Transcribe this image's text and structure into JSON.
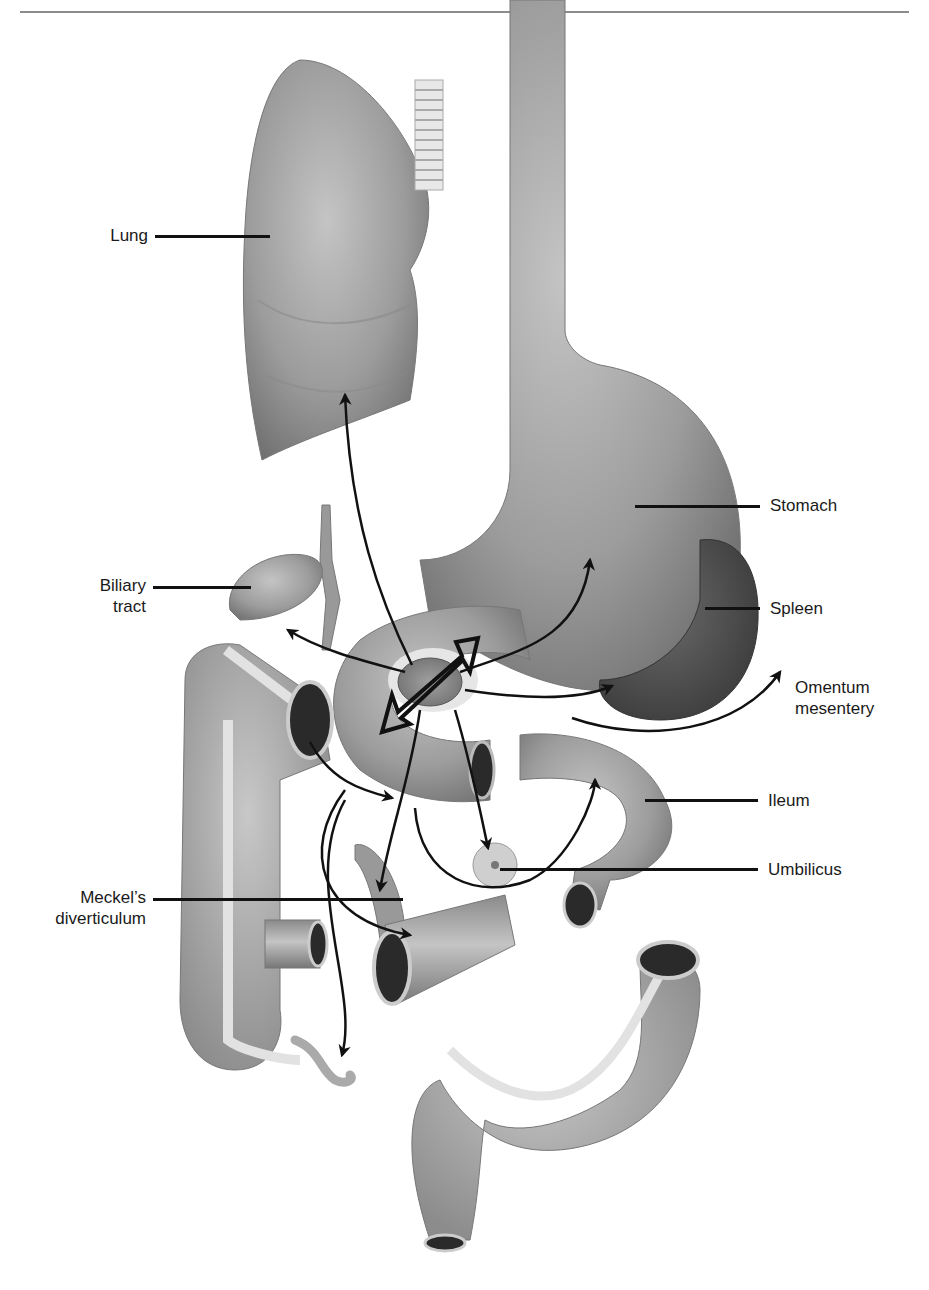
{
  "figure": {
    "type": "anatomical-diagram",
    "theme": "Sites of heterotopic pancreatic tissue / pancreatic rest locations",
    "colors": {
      "organ_fill": "#9a9a9a",
      "organ_dark": "#5e5e5e",
      "lumen": "#2a2a2a",
      "taenia": "#dcdcdc",
      "arrow": "#111111",
      "rule": "#8c8c8c"
    }
  },
  "labels": {
    "lung": "Lung",
    "stomach": "Stomach",
    "biliary_line1": "Biliary",
    "biliary_line2": "tract",
    "spleen": "Spleen",
    "omentum_line1": "Omentum",
    "omentum_line2": "mesentery",
    "ileum": "Ileum",
    "umbilicus": "Umbilicus",
    "meckel_line1": "Meckel’s",
    "meckel_line2": "diverticulum"
  }
}
